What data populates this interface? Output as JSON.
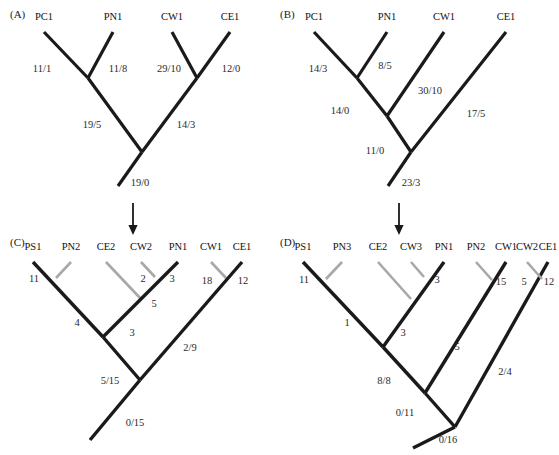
{
  "figure": {
    "width": 559,
    "height": 455,
    "background": "#ffffff",
    "colors": {
      "black_branch": "#1a1a1a",
      "gray_branch": "#a8a8a8",
      "text": "#111111",
      "label_text": "#2b2b2b"
    }
  },
  "panels": [
    {
      "id": "A",
      "label": "(A)",
      "label_pos": {
        "x": 10,
        "y": 8
      },
      "origin": {
        "x": 0,
        "y": 0
      },
      "tips": [
        {
          "name": "PC1",
          "x": 44,
          "y": 22
        },
        {
          "name": "PN1",
          "x": 113,
          "y": 22
        },
        {
          "name": "CW1",
          "x": 172,
          "y": 22
        },
        {
          "name": "CE1",
          "x": 230,
          "y": 22
        }
      ],
      "branches": [
        {
          "from": [
            44,
            32
          ],
          "to": [
            88,
            78
          ],
          "color": "black",
          "width": 3.2
        },
        {
          "from": [
            113,
            32
          ],
          "to": [
            88,
            78
          ],
          "color": "black",
          "width": 3.2
        },
        {
          "from": [
            172,
            32
          ],
          "to": [
            197,
            78
          ],
          "color": "black",
          "width": 3.2
        },
        {
          "from": [
            230,
            32
          ],
          "to": [
            197,
            78
          ],
          "color": "black",
          "width": 3.2
        },
        {
          "from": [
            88,
            78
          ],
          "to": [
            142,
            152
          ],
          "color": "black",
          "width": 3.2
        },
        {
          "from": [
            197,
            78
          ],
          "to": [
            142,
            152
          ],
          "color": "black",
          "width": 3.2
        },
        {
          "from": [
            142,
            152
          ],
          "to": [
            118,
            186
          ],
          "color": "black",
          "width": 3.2
        }
      ],
      "branch_labels": [
        {
          "text": "11/1",
          "x": 42,
          "y": 68
        },
        {
          "text": "11/8",
          "x": 118,
          "y": 68
        },
        {
          "text": "29/10",
          "x": 169,
          "y": 68
        },
        {
          "text": "12/0",
          "x": 231,
          "y": 68
        },
        {
          "text": "19/5",
          "x": 92,
          "y": 124
        },
        {
          "text": "14/3",
          "x": 186,
          "y": 124
        },
        {
          "text": "19/0",
          "x": 140,
          "y": 182
        }
      ]
    },
    {
      "id": "B",
      "label": "(B)",
      "label_pos": {
        "x": 280,
        "y": 8
      },
      "origin": {
        "x": 0,
        "y": 0
      },
      "tips": [
        {
          "name": "PC1",
          "x": 314,
          "y": 22
        },
        {
          "name": "PN1",
          "x": 387,
          "y": 22
        },
        {
          "name": "CW1",
          "x": 444,
          "y": 22
        },
        {
          "name": "CE1",
          "x": 506,
          "y": 22
        }
      ],
      "branches": [
        {
          "from": [
            314,
            32
          ],
          "to": [
            357,
            78
          ],
          "color": "black",
          "width": 3.2
        },
        {
          "from": [
            387,
            32
          ],
          "to": [
            357,
            78
          ],
          "color": "black",
          "width": 3.2
        },
        {
          "from": [
            357,
            78
          ],
          "to": [
            387,
            116
          ],
          "color": "black",
          "width": 3.2
        },
        {
          "from": [
            444,
            32
          ],
          "to": [
            387,
            116
          ],
          "color": "black",
          "width": 3.2
        },
        {
          "from": [
            387,
            116
          ],
          "to": [
            411,
            152
          ],
          "color": "black",
          "width": 3.2
        },
        {
          "from": [
            506,
            32
          ],
          "to": [
            411,
            152
          ],
          "color": "black",
          "width": 3.2
        },
        {
          "from": [
            411,
            152
          ],
          "to": [
            388,
            186
          ],
          "color": "black",
          "width": 3.2
        }
      ],
      "branch_labels": [
        {
          "text": "14/3",
          "x": 318,
          "y": 68
        },
        {
          "text": "8/5",
          "x": 385,
          "y": 65
        },
        {
          "text": "30/10",
          "x": 430,
          "y": 90
        },
        {
          "text": "17/5",
          "x": 476,
          "y": 113
        },
        {
          "text": "14/0",
          "x": 340,
          "y": 110
        },
        {
          "text": "11/0",
          "x": 375,
          "y": 150
        },
        {
          "text": "23/3",
          "x": 411,
          "y": 182
        }
      ]
    },
    {
      "id": "C",
      "label": "(C)",
      "label_pos": {
        "x": 10,
        "y": 236
      },
      "origin": {
        "x": 0,
        "y": 0
      },
      "tips": [
        {
          "name": "PS1",
          "x": 33,
          "y": 252
        },
        {
          "name": "PN2",
          "x": 71,
          "y": 252
        },
        {
          "name": "CE2",
          "x": 106,
          "y": 252
        },
        {
          "name": "CW2",
          "x": 141,
          "y": 252
        },
        {
          "name": "PN1",
          "x": 178,
          "y": 252
        },
        {
          "name": "CW1",
          "x": 211,
          "y": 252
        },
        {
          "name": "CE1",
          "x": 242,
          "y": 252
        }
      ],
      "branches": [
        {
          "from": [
            33,
            262
          ],
          "to": [
            103,
            337
          ],
          "color": "black",
          "width": 3.4
        },
        {
          "from": [
            71,
            262
          ],
          "to": [
            56,
            278
          ],
          "color": "gray",
          "width": 2.6
        },
        {
          "from": [
            106,
            262
          ],
          "to": [
            141,
            299
          ],
          "color": "gray",
          "width": 2.6
        },
        {
          "from": [
            141,
            262
          ],
          "to": [
            155,
            277
          ],
          "color": "gray",
          "width": 2.6
        },
        {
          "from": [
            178,
            262
          ],
          "to": [
            103,
            337
          ],
          "color": "black",
          "width": 3.4
        },
        {
          "from": [
            103,
            337
          ],
          "to": [
            140,
            380
          ],
          "color": "black",
          "width": 3.4
        },
        {
          "from": [
            211,
            262
          ],
          "to": [
            226,
            278
          ],
          "color": "gray",
          "width": 2.6
        },
        {
          "from": [
            242,
            262
          ],
          "to": [
            140,
            380
          ],
          "color": "black",
          "width": 3.4
        },
        {
          "from": [
            140,
            380
          ],
          "to": [
            90,
            440
          ],
          "color": "black",
          "width": 3.4
        }
      ],
      "branch_labels": [
        {
          "text": "11",
          "x": 34,
          "y": 278
        },
        {
          "text": "2",
          "x": 143,
          "y": 278
        },
        {
          "text": "3",
          "x": 172,
          "y": 278
        },
        {
          "text": "18",
          "x": 207,
          "y": 280
        },
        {
          "text": "12",
          "x": 243,
          "y": 280
        },
        {
          "text": "5",
          "x": 154,
          "y": 303
        },
        {
          "text": "4",
          "x": 77,
          "y": 322
        },
        {
          "text": "3",
          "x": 132,
          "y": 332
        },
        {
          "text": "2/9",
          "x": 190,
          "y": 347
        },
        {
          "text": "5/15",
          "x": 110,
          "y": 380
        },
        {
          "text": "0/15",
          "x": 135,
          "y": 422
        }
      ]
    },
    {
      "id": "D",
      "label": "(D)",
      "label_pos": {
        "x": 280,
        "y": 236
      },
      "origin": {
        "x": 0,
        "y": 0
      },
      "tips": [
        {
          "name": "PS1",
          "x": 303,
          "y": 252
        },
        {
          "name": "PN3",
          "x": 342,
          "y": 252
        },
        {
          "name": "CE2",
          "x": 378,
          "y": 252
        },
        {
          "name": "CW3",
          "x": 411,
          "y": 252
        },
        {
          "name": "PN1",
          "x": 444,
          "y": 252
        },
        {
          "name": "PN2",
          "x": 476,
          "y": 252
        },
        {
          "name": "CW1",
          "x": 506,
          "y": 252
        },
        {
          "name": "CW2",
          "x": 527,
          "y": 252
        },
        {
          "name": "CE1",
          "x": 548,
          "y": 252
        }
      ],
      "branches": [
        {
          "from": [
            303,
            262
          ],
          "to": [
            383,
            347
          ],
          "color": "black",
          "width": 3.4
        },
        {
          "from": [
            342,
            262
          ],
          "to": [
            326,
            279
          ],
          "color": "gray",
          "width": 2.6
        },
        {
          "from": [
            378,
            262
          ],
          "to": [
            411,
            299
          ],
          "color": "gray",
          "width": 2.6
        },
        {
          "from": [
            411,
            262
          ],
          "to": [
            424,
            277
          ],
          "color": "gray",
          "width": 2.6
        },
        {
          "from": [
            444,
            262
          ],
          "to": [
            383,
            347
          ],
          "color": "black",
          "width": 3.4
        },
        {
          "from": [
            383,
            347
          ],
          "to": [
            425,
            393
          ],
          "color": "black",
          "width": 3.4
        },
        {
          "from": [
            506,
            262
          ],
          "to": [
            425,
            393
          ],
          "color": "black",
          "width": 3.4
        },
        {
          "from": [
            476,
            262
          ],
          "to": [
            492,
            280
          ],
          "color": "gray",
          "width": 2.6
        },
        {
          "from": [
            425,
            393
          ],
          "to": [
            455,
            427
          ],
          "color": "black",
          "width": 3.4
        },
        {
          "from": [
            548,
            262
          ],
          "to": [
            455,
            427
          ],
          "color": "black",
          "width": 3.4
        },
        {
          "from": [
            527,
            262
          ],
          "to": [
            542,
            279
          ],
          "color": "gray",
          "width": 2.6
        },
        {
          "from": [
            455,
            427
          ],
          "to": [
            413,
            448
          ],
          "color": "black",
          "width": 3.4
        }
      ],
      "branch_labels": [
        {
          "text": "11",
          "x": 304,
          "y": 279
        },
        {
          "text": "3",
          "x": 437,
          "y": 279
        },
        {
          "text": "15",
          "x": 501,
          "y": 281
        },
        {
          "text": "5",
          "x": 524,
          "y": 281
        },
        {
          "text": "12",
          "x": 549,
          "y": 281
        },
        {
          "text": "1",
          "x": 347,
          "y": 322
        },
        {
          "text": "3",
          "x": 403,
          "y": 332
        },
        {
          "text": "5",
          "x": 457,
          "y": 346
        },
        {
          "text": "2/4",
          "x": 505,
          "y": 371
        },
        {
          "text": "8/8",
          "x": 384,
          "y": 380
        },
        {
          "text": "0/11",
          "x": 405,
          "y": 412
        },
        {
          "text": "0/16",
          "x": 448,
          "y": 439
        }
      ]
    }
  ],
  "arrows": [
    {
      "name": "arrow-a-to-c",
      "x": 133,
      "y": 203,
      "length": 30
    },
    {
      "name": "arrow-b-to-d",
      "x": 399,
      "y": 203,
      "length": 30
    }
  ]
}
